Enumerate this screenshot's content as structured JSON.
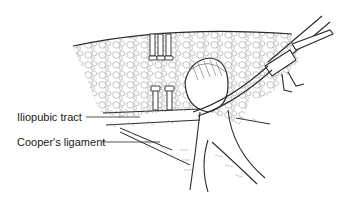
{
  "figure": {
    "colors": {
      "line": "#2a2a2a",
      "hatch": "#8a8a8a",
      "background": "#ffffff"
    },
    "labels": [
      {
        "text": "Iliopubic tract"
      },
      {
        "text": "Cooper's ligament"
      }
    ]
  }
}
